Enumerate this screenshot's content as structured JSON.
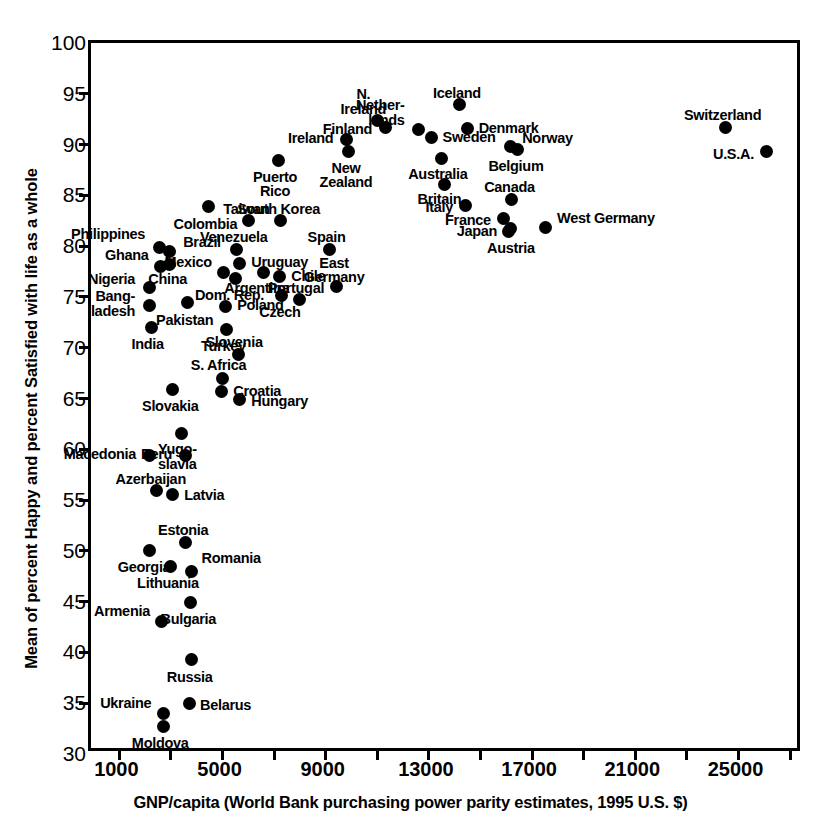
{
  "chart_data": {
    "type": "scatter",
    "title": "",
    "xlabel": "GNP/capita (World Bank purchasing power parity estimates, 1995 U.S. $)",
    "ylabel": "Mean of percent Happy and percent Satisfied with life as a whole",
    "xlim": [
      -100,
      27500
    ],
    "ylim": [
      30,
      100
    ],
    "xticks": [
      1000,
      3000,
      5000,
      7000,
      9000,
      11000,
      13000,
      15000,
      17000,
      19000,
      21000,
      23000,
      25000,
      27000
    ],
    "xticklabels": [
      "1000",
      "",
      "5000",
      "",
      "9000",
      "",
      "13000",
      "",
      "17000",
      "",
      "21000",
      "",
      "25000",
      ""
    ],
    "yticks": [
      30,
      35,
      40,
      45,
      50,
      55,
      60,
      65,
      70,
      75,
      80,
      85,
      90,
      95,
      100
    ],
    "yticklabels": [
      "30",
      "35",
      "40",
      "45",
      "50",
      "55",
      "60",
      "65",
      "70",
      "75",
      "80",
      "85",
      "90",
      "95",
      "100"
    ],
    "grid": false,
    "legend": false,
    "marker_color": "#000000",
    "points": [
      {
        "name": "Philippines",
        "x": 2540,
        "y": 79.9,
        "label": "Philippines",
        "lx": -14,
        "ly": -20,
        "anchor": "r"
      },
      {
        "name": "Brazil",
        "x": 2930,
        "y": 79.5,
        "label": "Brazil",
        "lx": 14,
        "ly": -16,
        "anchor": "l"
      },
      {
        "name": "Ghana",
        "x": 2600,
        "y": 78.0,
        "label": "Ghana",
        "lx": -12,
        "ly": -18,
        "anchor": "r"
      },
      {
        "name": "China",
        "x": 2950,
        "y": 78.2,
        "label": "China",
        "lx": -2,
        "ly": 8,
        "anchor": "c"
      },
      {
        "name": "Nigeria",
        "x": 2150,
        "y": 75.9,
        "label": "Nigeria",
        "lx": -14,
        "ly": -16,
        "anchor": "r"
      },
      {
        "name": "Bangladesh",
        "x": 2150,
        "y": 74.2,
        "label": "Bang-\nladesh",
        "lx": -14,
        "ly": -16,
        "anchor": "r"
      },
      {
        "name": "India",
        "x": 2250,
        "y": 72.0,
        "label": "India",
        "lx": -4,
        "ly": 10,
        "anchor": "c"
      },
      {
        "name": "Pakistan",
        "x": 3650,
        "y": 74.5,
        "label": "Pakistan",
        "lx": -3,
        "ly": 11,
        "anchor": "c"
      },
      {
        "name": "Colombia",
        "x": 4450,
        "y": 83.9,
        "label": "Colombia",
        "lx": -3,
        "ly": 10,
        "anchor": "c"
      },
      {
        "name": "Mexico",
        "x": 5050,
        "y": 77.4,
        "label": "Mexico",
        "lx": -12,
        "ly": -18,
        "anchor": "r"
      },
      {
        "name": "Dom. Rep.",
        "x": 5500,
        "y": 76.8,
        "label": "Dom. Rep.",
        "lx": -6,
        "ly": 9,
        "anchor": "c"
      },
      {
        "name": "Poland",
        "x": 5100,
        "y": 74.1,
        "label": "Poland",
        "lx": 12,
        "ly": -8,
        "anchor": "l"
      },
      {
        "name": "Turkey",
        "x": 5150,
        "y": 71.8,
        "label": "Turkey",
        "lx": -3,
        "ly": 10,
        "anchor": "c"
      },
      {
        "name": "S. Africa",
        "x": 5000,
        "y": 67.0,
        "label": "S. Africa",
        "lx": -4,
        "ly": -20,
        "anchor": "c"
      },
      {
        "name": "Slovakia",
        "x": 3050,
        "y": 65.9,
        "label": "Slovakia",
        "lx": -2,
        "ly": 10,
        "anchor": "c"
      },
      {
        "name": "Croatia",
        "x": 4950,
        "y": 65.7,
        "label": "Croatia",
        "lx": 12,
        "ly": -7,
        "anchor": "l"
      },
      {
        "name": "Yugo-slavia",
        "x": 3400,
        "y": 61.6,
        "label": "Yugo-\nslavia",
        "lx": -4,
        "ly": 9,
        "anchor": "c"
      },
      {
        "name": "Hungary",
        "x": 5650,
        "y": 64.9,
        "label": "Hungary",
        "lx": 12,
        "ly": -6,
        "anchor": "l"
      },
      {
        "name": "Macedonia",
        "x": 2150,
        "y": 59.4,
        "label": "Macedonia",
        "lx": -13,
        "ly": -8,
        "anchor": "r"
      },
      {
        "name": "Peru",
        "x": 3550,
        "y": 59.4,
        "label": "Peru",
        "lx": -13,
        "ly": -8,
        "anchor": "r"
      },
      {
        "name": "Azerbaijan",
        "x": 2450,
        "y": 55.9,
        "label": "Azerbaijan",
        "lx": -6,
        "ly": -19,
        "anchor": "c"
      },
      {
        "name": "Latvia",
        "x": 3050,
        "y": 55.5,
        "label": "Latvia",
        "lx": 12,
        "ly": -7,
        "anchor": "l"
      },
      {
        "name": "Estonia",
        "x": 3550,
        "y": 50.8,
        "label": "Estonia",
        "lx": -2,
        "ly": -20,
        "anchor": "c"
      },
      {
        "name": "Georgia",
        "x": 2150,
        "y": 50.0,
        "label": "Georgia",
        "lx": -5,
        "ly": 9,
        "anchor": "c"
      },
      {
        "name": "Lithuania",
        "x": 3000,
        "y": 48.5,
        "label": "Lithuania",
        "lx": -3,
        "ly": 10,
        "anchor": "c"
      },
      {
        "name": "Romania",
        "x": 3800,
        "y": 48.0,
        "label": "Romania",
        "lx": 10,
        "ly": -20,
        "anchor": "l"
      },
      {
        "name": "Armenia",
        "x": 2650,
        "y": 43.0,
        "label": "Armenia",
        "lx": -12,
        "ly": -18,
        "anchor": "r"
      },
      {
        "name": "Bulgaria",
        "x": 3750,
        "y": 44.9,
        "label": "Bulgaria",
        "lx": -2,
        "ly": 9,
        "anchor": "c"
      },
      {
        "name": "Russia",
        "x": 3800,
        "y": 39.3,
        "label": "Russia",
        "lx": -2,
        "ly": 10,
        "anchor": "c"
      },
      {
        "name": "Ukraine",
        "x": 2700,
        "y": 34.0,
        "label": "Ukraine",
        "lx": -12,
        "ly": -17,
        "anchor": "r"
      },
      {
        "name": "Belarus",
        "x": 3700,
        "y": 35.0,
        "label": "Belarus",
        "lx": 11,
        "ly": -5,
        "anchor": "l"
      },
      {
        "name": "Moldova",
        "x": 2700,
        "y": 32.7,
        "label": "Moldova",
        "lx": -3,
        "ly": 9,
        "anchor": "c"
      },
      {
        "name": "Slovenia",
        "x": 5600,
        "y": 69.3,
        "label": "Slovenia",
        "lx": -4,
        "ly": -20,
        "anchor": "c"
      },
      {
        "name": "Venezuela",
        "x": 5550,
        "y": 79.7,
        "label": "Venezuela",
        "lx": -3,
        "ly": -19,
        "anchor": "c"
      },
      {
        "name": "Uruguay",
        "x": 5650,
        "y": 78.3,
        "label": "Uruguay",
        "lx": 12,
        "ly": -8,
        "anchor": "l"
      },
      {
        "name": "Argentina",
        "x": 6600,
        "y": 77.4,
        "label": "Argentina",
        "lx": -7,
        "ly": 8,
        "anchor": "c"
      },
      {
        "name": "Chile",
        "x": 7200,
        "y": 77.0,
        "label": "Chile",
        "lx": 12,
        "ly": -8,
        "anchor": "l"
      },
      {
        "name": "Czech",
        "x": 7300,
        "y": 75.1,
        "label": "Czech",
        "lx": -2,
        "ly": 9,
        "anchor": "c"
      },
      {
        "name": "Taiwan",
        "x": 6000,
        "y": 82.5,
        "label": "Taiwan",
        "lx": -2,
        "ly": -19,
        "anchor": "c"
      },
      {
        "name": "South Korea",
        "x": 7250,
        "y": 82.5,
        "label": "South Korea",
        "lx": -2,
        "ly": -19,
        "anchor": "c"
      },
      {
        "name": "Puerto Rico",
        "x": 7150,
        "y": 88.4,
        "label": "Puerto\nRico",
        "lx": -3,
        "ly": 9,
        "anchor": "c"
      },
      {
        "name": "Portugal",
        "x": 8000,
        "y": 74.7,
        "label": "Portugal",
        "lx": -4,
        "ly": -19,
        "anchor": "c"
      },
      {
        "name": "Spain",
        "x": 9150,
        "y": 79.7,
        "label": "Spain",
        "lx": -3,
        "ly": -19,
        "anchor": "c"
      },
      {
        "name": "East Germany",
        "x": 9400,
        "y": 76.0,
        "label": "East\nGermany",
        "lx": -2,
        "ly": -31,
        "anchor": "c"
      },
      {
        "name": "Ireland",
        "x": 9800,
        "y": 90.5,
        "label": "Ireland",
        "lx": -13,
        "ly": -8,
        "anchor": "r"
      },
      {
        "name": "New Zealand",
        "x": 9900,
        "y": 89.3,
        "label": "New\nZealand",
        "lx": -3,
        "ly": 9,
        "anchor": "c"
      },
      {
        "name": "N. Ireland",
        "x": 11000,
        "y": 92.4,
        "label": "N.\nIreland",
        "lx": -14,
        "ly": -33,
        "anchor": "c"
      },
      {
        "name": "Finland",
        "x": 11300,
        "y": 91.7,
        "label": "Finland",
        "lx": -13,
        "ly": -5,
        "anchor": "r"
      },
      {
        "name": "Netherlands",
        "x": 12600,
        "y": 91.5,
        "label": "Nether-\nlands",
        "lx": -14,
        "ly": -31,
        "anchor": "r"
      },
      {
        "name": "Sweden",
        "x": 13100,
        "y": 90.7,
        "label": "Sweden",
        "lx": 11,
        "ly": -7,
        "anchor": "l"
      },
      {
        "name": "Australia",
        "x": 13500,
        "y": 88.6,
        "label": "Australia",
        "lx": -4,
        "ly": 8,
        "anchor": "c"
      },
      {
        "name": "Iceland",
        "x": 14200,
        "y": 93.9,
        "label": "Iceland",
        "lx": -3,
        "ly": -19,
        "anchor": "c"
      },
      {
        "name": "Denmark",
        "x": 14500,
        "y": 91.6,
        "label": "Denmark",
        "lx": 11,
        "ly": -7,
        "anchor": "l"
      },
      {
        "name": "Britain",
        "x": 13600,
        "y": 86.1,
        "label": "Britain",
        "lx": -5,
        "ly": 8,
        "anchor": "c"
      },
      {
        "name": "Italy",
        "x": 14400,
        "y": 84.0,
        "label": "Italy",
        "lx": -12,
        "ly": -6,
        "anchor": "r"
      },
      {
        "name": "Norway",
        "x": 16150,
        "y": 89.8,
        "label": "Norway",
        "lx": 12,
        "ly": -16,
        "anchor": "l"
      },
      {
        "name": "Belgium",
        "x": 16450,
        "y": 89.5,
        "label": "Belgium",
        "lx": -2,
        "ly": 9,
        "anchor": "c"
      },
      {
        "name": "Canada",
        "x": 16200,
        "y": 84.6,
        "label": "Canada",
        "lx": -2,
        "ly": -19,
        "anchor": "c"
      },
      {
        "name": "France",
        "x": 15900,
        "y": 82.7,
        "label": "France",
        "lx": -13,
        "ly": -6,
        "anchor": "r"
      },
      {
        "name": "Japan",
        "x": 16150,
        "y": 81.7,
        "label": "Japan",
        "lx": -13,
        "ly": -5,
        "anchor": "r"
      },
      {
        "name": "Austria",
        "x": 16100,
        "y": 81.4,
        "label": "Austria",
        "lx": 2,
        "ly": 9,
        "anchor": "c"
      },
      {
        "name": "West Germany",
        "x": 17500,
        "y": 81.8,
        "label": "West Germany",
        "lx": 12,
        "ly": -17,
        "anchor": "l"
      },
      {
        "name": "Switzerland",
        "x": 24500,
        "y": 91.7,
        "label": "Switzerland",
        "lx": -3,
        "ly": -19,
        "anchor": "c"
      },
      {
        "name": "U.S.A.",
        "x": 26100,
        "y": 89.3,
        "label": "U.S.A.",
        "lx": -13,
        "ly": -5,
        "anchor": "r"
      }
    ]
  }
}
